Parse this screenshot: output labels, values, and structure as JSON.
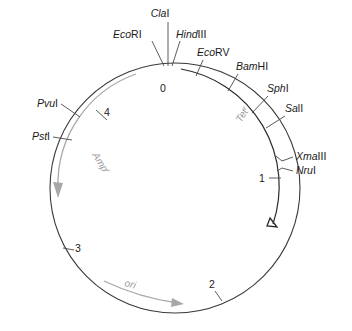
{
  "figure": {
    "type": "plasmid-map",
    "title": "",
    "circle": {
      "center_x": 175,
      "center_y": 188,
      "radius": 125
    }
  },
  "restriction_sites": [
    {
      "id": "clai",
      "prefix": "Cla",
      "suffix": "I",
      "label": "ClaI",
      "label_x": 160,
      "label_y": 17,
      "anchor": "middle"
    },
    {
      "id": "ecori",
      "prefix": "Eco",
      "suffix": "RI",
      "label": "EcoRI",
      "label_x": 113,
      "label_y": 38,
      "anchor": "start"
    },
    {
      "id": "hindiii",
      "prefix": "Hind",
      "suffix": "III",
      "label": "HindIII",
      "label_x": 176,
      "label_y": 38,
      "anchor": "start"
    },
    {
      "id": "ecorv",
      "prefix": "Eco",
      "suffix": "RV",
      "label": "EcoRV",
      "label_x": 197,
      "label_y": 56,
      "anchor": "start"
    },
    {
      "id": "bamhi",
      "prefix": "Bam",
      "suffix": "HI",
      "label": "BamHI",
      "label_x": 236,
      "label_y": 70,
      "anchor": "start"
    },
    {
      "id": "sphi",
      "prefix": "Sph",
      "suffix": "I",
      "label": "SphI",
      "label_x": 267,
      "label_y": 92,
      "anchor": "start"
    },
    {
      "id": "sali",
      "prefix": "Sa",
      "suffix": "lI",
      "label": "SalI",
      "label_x": 285,
      "label_y": 112,
      "anchor": "start"
    },
    {
      "id": "xmaiii",
      "prefix": "Xma",
      "suffix": "III",
      "label": "XmaIII",
      "label_x": 296,
      "label_y": 160,
      "anchor": "start"
    },
    {
      "id": "nrui",
      "prefix": "Nru",
      "suffix": "I",
      "label": "NruI",
      "label_x": 296,
      "label_y": 174,
      "anchor": "start"
    },
    {
      "id": "pvui",
      "prefix": "Pvu",
      "suffix": "I",
      "label": "PvuI",
      "label_x": 58,
      "label_y": 107,
      "anchor": "end"
    },
    {
      "id": "psti",
      "prefix": "Pst",
      "suffix": "I",
      "label": "PstI",
      "label_x": 50,
      "label_y": 140,
      "anchor": "end"
    }
  ],
  "coordinate_ticks": [
    {
      "id": "tick-0",
      "value": "0",
      "label_x": 163,
      "label_y": 92
    },
    {
      "id": "tick-1",
      "value": "1",
      "label_x": 262,
      "label_y": 182
    },
    {
      "id": "tick-2",
      "value": "2",
      "label_x": 212,
      "label_y": 288
    },
    {
      "id": "tick-3",
      "value": "3",
      "label_x": 78,
      "label_y": 252
    },
    {
      "id": "tick-4",
      "value": "4",
      "label_x": 107,
      "label_y": 116
    }
  ],
  "gene_regions": [
    {
      "id": "ampr",
      "label": "Amp",
      "superscript": "r",
      "color": "#a8a8a8",
      "direction": "counterclockwise"
    },
    {
      "id": "tetr",
      "label": "Tet",
      "superscript": "r",
      "color": "#9a9a9a",
      "direction": "clockwise"
    },
    {
      "id": "ori",
      "label": "ori",
      "superscript": "",
      "color": "#a8a8a8",
      "direction": "clockwise"
    }
  ],
  "colors": {
    "backbone": "#3a3a3a",
    "gene_gray": "#a8a8a8",
    "gene_dark": "#2a2a2a",
    "text": "#1a1a1a",
    "background": "#ffffff"
  }
}
